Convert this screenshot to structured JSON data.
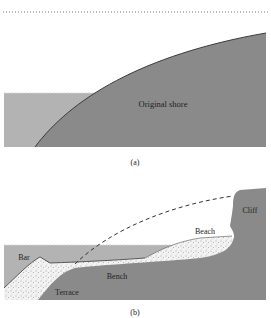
{
  "figure": {
    "panels": [
      {
        "id": "a",
        "caption": "(a)",
        "labels": {
          "original_shore": "Original shore"
        }
      },
      {
        "id": "b",
        "caption": "(b)",
        "labels": {
          "cliff": "Cliff",
          "beach": "Beach",
          "bar": "Bar",
          "bench": "Bench",
          "terrace": "Terrace"
        }
      }
    ]
  },
  "colors": {
    "land": "#8a8a8a",
    "water": "#b3b3b3",
    "sand": "#f2f2f2",
    "outline": "#3a3a3a",
    "background": "#ffffff"
  }
}
